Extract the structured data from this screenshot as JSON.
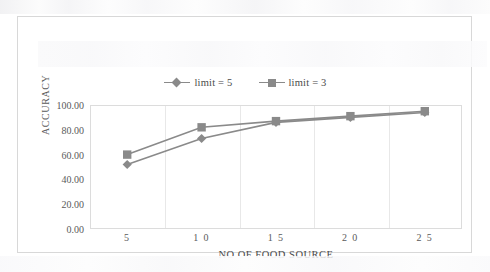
{
  "chart_data": {
    "type": "line",
    "title": "",
    "xlabel": "NO OF FOOD SOURCE",
    "ylabel": "ACCURACY",
    "categories": [
      "5",
      "10",
      "15",
      "20",
      "25"
    ],
    "x_tick_labels": [
      "5",
      "1 0",
      "1 5",
      "2 0",
      "2 5"
    ],
    "y_tick_labels": [
      "0.00",
      "20.00",
      "40.00",
      "60.00",
      "80.00",
      "100.00"
    ],
    "y_ticks": [
      0,
      20,
      40,
      60,
      80,
      100
    ],
    "ylim": [
      0,
      100
    ],
    "grid": "vertical-only",
    "legend_position": "top-center",
    "series": [
      {
        "name": "limit = 5",
        "marker": "diamond",
        "color": "#8a8a8a",
        "values": [
          52,
          73,
          86,
          90,
          94
        ]
      },
      {
        "name": "limit = 3",
        "marker": "square",
        "color": "#8a8a8a",
        "values": [
          60,
          82,
          87,
          91,
          95
        ]
      }
    ]
  },
  "legend": {
    "entries": [
      {
        "label": "limit = 5",
        "marker": "diamond-marker-icon"
      },
      {
        "label": "limit = 3",
        "marker": "square-marker-icon"
      }
    ]
  },
  "colors": {
    "series": "#8a8a8a",
    "gridline": "#e8e8e8",
    "plot_border": "#dcdcdc",
    "figure_border": "#d8d8d8",
    "axis_text": "#5a5a5a"
  }
}
